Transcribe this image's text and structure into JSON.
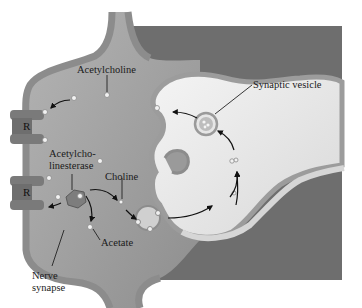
{
  "diagram": {
    "type": "biological-illustration",
    "labels": {
      "acetylcholine": "Acetylcholine",
      "synaptic_vesicle": "Synaptic vesicle",
      "acetylcholinesterase_line1": "Acetylcho-",
      "acetylcholinesterase_line2": "linesterase",
      "choline": "Choline",
      "acetate": "Acetate",
      "nerve_synapse_line1": "Nerve",
      "nerve_synapse_line2": "synapse",
      "receptor_top": "R",
      "receptor_bottom": "R"
    },
    "colors": {
      "background": "#ffffff",
      "dark_region": "#6e6e6e",
      "cleft": "#9a9a9a",
      "membrane": "#8c8c8c",
      "terminal": "#ececec",
      "receptor": "#7a7a7a",
      "arrow": "#111111"
    }
  }
}
